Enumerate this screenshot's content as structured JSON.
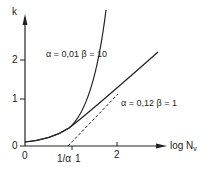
{
  "figure": {
    "y_axis": {
      "label": "k",
      "ticks": [
        "0",
        "1",
        "2"
      ]
    },
    "x_axis": {
      "label_main": "log N",
      "label_sub": "v",
      "ticks": [
        "0",
        "1",
        "2"
      ],
      "special_tick": "1/α"
    },
    "curves": [
      {
        "name": "steep",
        "label": "α = 0,01  β = 10"
      },
      {
        "name": "shallow",
        "label": "α = 0,12  β = 1"
      }
    ],
    "asymptote": "dashed tangent line through 1/α"
  }
}
